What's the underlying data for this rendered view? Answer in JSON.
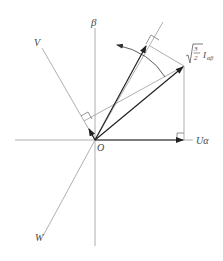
{
  "diagram": {
    "type": "vector-diagram",
    "labels": {
      "beta": "β",
      "v": "V",
      "w": "W",
      "origin": "O",
      "u_alpha": "Uα",
      "sqrt_num": "3",
      "sqrt_den": "2",
      "current": "I",
      "current_sub": "αβ"
    },
    "colors": {
      "axis": "#9a9a9a",
      "vector": "#222222",
      "text": "#444444"
    }
  }
}
